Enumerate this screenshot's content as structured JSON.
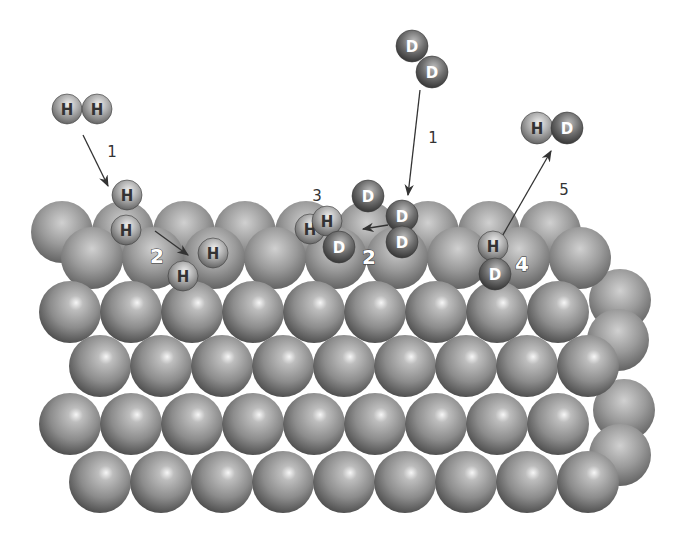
{
  "colors": {
    "background": "#ffffff",
    "metal_light": "#f4f4f4",
    "metal_mid": "#9a9a9a",
    "metal_dark": "#4a4a4a",
    "h_light": "#f0f0f0",
    "h_dark": "#5a5a5a",
    "d_light": "#bdbdbd",
    "d_dark": "#2e2e2e",
    "arrow": "#333333",
    "h_text": "#333333",
    "d_text": "#ffffff"
  },
  "surface": {
    "radius": 31,
    "back_rows": [
      {
        "y": 232,
        "xs": [
          62,
          123,
          184,
          245,
          306,
          367,
          428,
          489,
          550
        ]
      },
      {
        "y": 258,
        "xs": [
          92,
          153,
          214,
          275,
          336,
          397,
          458,
          519,
          580
        ]
      }
    ],
    "front_rows": [
      {
        "y": 312,
        "xs": [
          70,
          131,
          192,
          253,
          314,
          375,
          436,
          497,
          558
        ]
      },
      {
        "y": 366,
        "xs": [
          100,
          161,
          222,
          283,
          344,
          405,
          466,
          527,
          588
        ]
      },
      {
        "y": 424,
        "xs": [
          70,
          131,
          192,
          253,
          314,
          375,
          436,
          497,
          558
        ]
      },
      {
        "y": 482,
        "xs": [
          100,
          161,
          222,
          283,
          344,
          405,
          466,
          527,
          588
        ]
      }
    ],
    "side_spheres": [
      {
        "x": 620,
        "y": 300
      },
      {
        "x": 618,
        "y": 340
      },
      {
        "x": 624,
        "y": 410
      },
      {
        "x": 620,
        "y": 455
      }
    ]
  },
  "atoms": [
    {
      "id": "h2-gas-a",
      "element": "H",
      "x": 67,
      "y": 109,
      "r": 15
    },
    {
      "id": "h2-gas-b",
      "element": "H",
      "x": 97,
      "y": 109,
      "r": 15
    },
    {
      "id": "h2-ads-a",
      "element": "H",
      "x": 127,
      "y": 195,
      "r": 15
    },
    {
      "id": "h2-ads-b",
      "element": "H",
      "x": 126,
      "y": 230,
      "r": 15
    },
    {
      "id": "h-diss-a",
      "element": "H",
      "x": 213,
      "y": 253,
      "r": 15
    },
    {
      "id": "h-diss-b",
      "element": "H",
      "x": 183,
      "y": 276,
      "r": 15
    },
    {
      "id": "d2-gas-a",
      "element": "D",
      "x": 412,
      "y": 46,
      "r": 16
    },
    {
      "id": "d2-gas-b",
      "element": "D",
      "x": 432,
      "y": 72,
      "r": 16
    },
    {
      "id": "d-top",
      "element": "D",
      "x": 368,
      "y": 196,
      "r": 16
    },
    {
      "id": "d-ads-a",
      "element": "D",
      "x": 402,
      "y": 216,
      "r": 16
    },
    {
      "id": "d-ads-b",
      "element": "D",
      "x": 402,
      "y": 242,
      "r": 16
    },
    {
      "id": "h-mix-back",
      "element": "H",
      "x": 310,
      "y": 229,
      "r": 15
    },
    {
      "id": "h-mix-front",
      "element": "H",
      "x": 327,
      "y": 221,
      "r": 15
    },
    {
      "id": "d-mix",
      "element": "D",
      "x": 339,
      "y": 247,
      "r": 16
    },
    {
      "id": "hd-form-h",
      "element": "H",
      "x": 493,
      "y": 246,
      "r": 15
    },
    {
      "id": "hd-form-d",
      "element": "D",
      "x": 495,
      "y": 274,
      "r": 16
    },
    {
      "id": "hd-gas-h",
      "element": "H",
      "x": 537,
      "y": 128,
      "r": 16
    },
    {
      "id": "hd-gas-d",
      "element": "D",
      "x": 567,
      "y": 128,
      "r": 16
    }
  ],
  "arrows": [
    {
      "id": "arrow-h2-adsorb",
      "x1": 83,
      "y1": 135,
      "x2": 108,
      "y2": 186
    },
    {
      "id": "arrow-h-dissociate",
      "x1": 155,
      "y1": 231,
      "x2": 188,
      "y2": 255
    },
    {
      "id": "arrow-d2-adsorb",
      "x1": 420,
      "y1": 90,
      "x2": 408,
      "y2": 195
    },
    {
      "id": "arrow-d-dissociate",
      "x1": 388,
      "y1": 225,
      "x2": 363,
      "y2": 229
    },
    {
      "id": "arrow-hd-desorb",
      "x1": 500,
      "y1": 240,
      "x2": 551,
      "y2": 151
    }
  ],
  "step_labels": [
    {
      "id": "step-1-h2",
      "text": "1",
      "x": 112,
      "y": 152,
      "big": false
    },
    {
      "id": "step-2-h",
      "text": "2",
      "x": 157,
      "y": 256,
      "big": true
    },
    {
      "id": "step-1-d2",
      "text": "1",
      "x": 433,
      "y": 138,
      "big": false
    },
    {
      "id": "step-3",
      "text": "3",
      "x": 317,
      "y": 196,
      "big": false
    },
    {
      "id": "step-2-d",
      "text": "2",
      "x": 369,
      "y": 257,
      "big": true
    },
    {
      "id": "step-4",
      "text": "4",
      "x": 522,
      "y": 264,
      "big": true
    },
    {
      "id": "step-5",
      "text": "5",
      "x": 564,
      "y": 190,
      "big": false
    }
  ]
}
